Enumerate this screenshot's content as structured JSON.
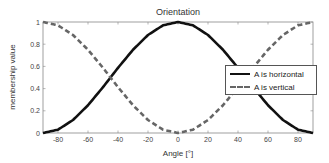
{
  "chart": {
    "title": "Orientation",
    "xlabel": "Angle [°]",
    "ylabel": "membership value",
    "legend": [
      {
        "label": "A is horizontal",
        "style": "solid",
        "color": "#111111"
      },
      {
        "label": "A is vertical",
        "style": "dashed",
        "color": "#666666"
      }
    ]
  },
  "chart_data": {
    "type": "line",
    "title": "Orientation",
    "xlabel": "Angle [°]",
    "ylabel": "membership value",
    "xlim": [
      -90,
      90
    ],
    "ylim": [
      0,
      1
    ],
    "xticks": [
      -80,
      -60,
      -40,
      -20,
      0,
      20,
      40,
      60,
      80
    ],
    "yticks": [
      0,
      0.2,
      0.4,
      0.6,
      0.8,
      1
    ],
    "grid": false,
    "legend_position": "right-center inside",
    "x": [
      -90,
      -80,
      -70,
      -60,
      -50,
      -45,
      -40,
      -30,
      -20,
      -10,
      0,
      10,
      20,
      30,
      40,
      45,
      50,
      60,
      70,
      80,
      90
    ],
    "series": [
      {
        "name": "A is horizontal",
        "style": "solid",
        "color": "#111111",
        "values": [
          0.0,
          0.03,
          0.117,
          0.25,
          0.413,
          0.5,
          0.587,
          0.75,
          0.883,
          0.97,
          1.0,
          0.97,
          0.883,
          0.75,
          0.587,
          0.5,
          0.413,
          0.25,
          0.117,
          0.03,
          0.0
        ]
      },
      {
        "name": "A is vertical",
        "style": "dashed",
        "color": "#666666",
        "values": [
          1.0,
          0.97,
          0.883,
          0.75,
          0.587,
          0.5,
          0.413,
          0.25,
          0.117,
          0.03,
          0.0,
          0.03,
          0.117,
          0.25,
          0.413,
          0.5,
          0.587,
          0.75,
          0.883,
          0.97,
          1.0
        ]
      }
    ]
  }
}
